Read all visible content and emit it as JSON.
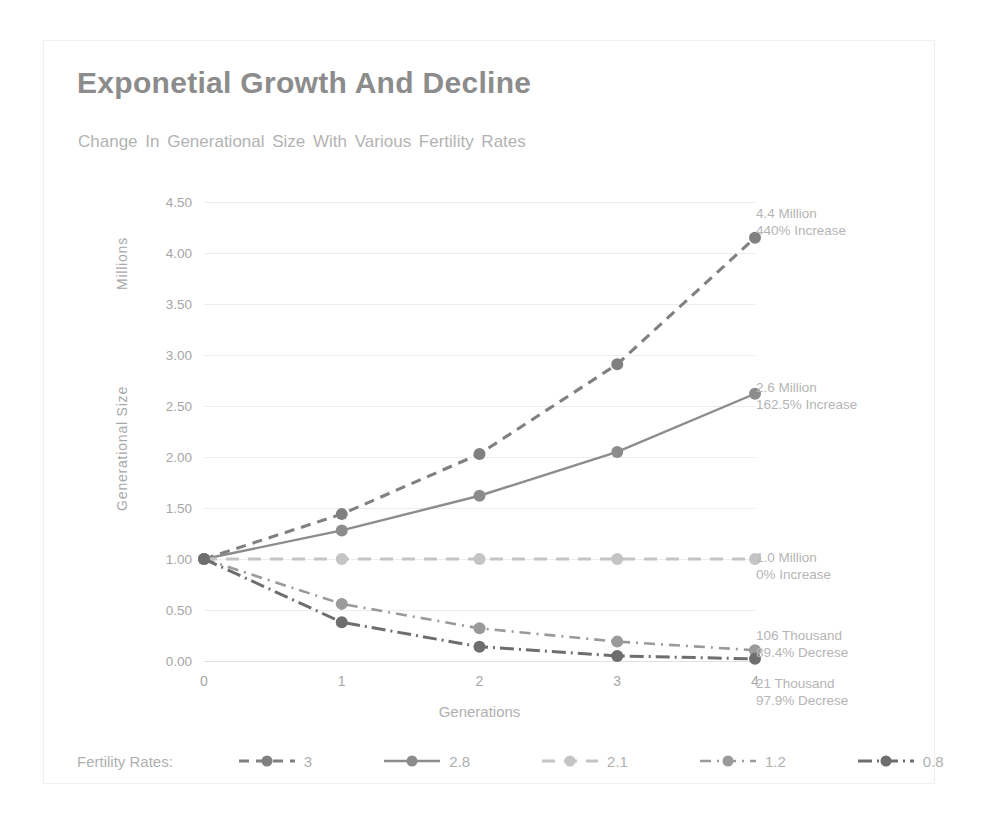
{
  "chart_data": {
    "type": "line",
    "title": "Exponetial Growth And Decline",
    "subtitle": "Change In Generational Size With Various Fertility Rates",
    "xlabel": "Generations",
    "ylabel": "Generational Size",
    "yunits": "Millions",
    "x": [
      0,
      1,
      2,
      3,
      4
    ],
    "categories": [
      "0",
      "1",
      "2",
      "3",
      "4"
    ],
    "xticklabels": [
      "0",
      "1",
      "2",
      "3",
      "4"
    ],
    "yticklabels": [
      "0.00",
      "0.50",
      "1.00",
      "1.50",
      "2.00",
      "2.50",
      "3.00",
      "3.50",
      "4.00",
      "4.50"
    ],
    "yticks": [
      0.0,
      0.5,
      1.0,
      1.5,
      2.0,
      2.5,
      3.0,
      3.5,
      4.0,
      4.5
    ],
    "ylim": [
      0.0,
      4.5
    ],
    "xlim": [
      0,
      4
    ],
    "grid": "horizontal",
    "legend_position": "bottom",
    "legend_title": "Fertility Rates:",
    "series": [
      {
        "name": "3",
        "values": [
          1.0,
          1.44,
          2.03,
          2.91,
          4.15
        ],
        "color": "#808080",
        "dash": "10,7",
        "width": 3.1,
        "marker": "circle"
      },
      {
        "name": "2.8",
        "values": [
          1.0,
          1.28,
          1.62,
          2.05,
          2.62
        ],
        "color": "#8c8c8c",
        "dash": "",
        "width": 2.4,
        "marker": "circle"
      },
      {
        "name": "2.1",
        "values": [
          1.0,
          1.0,
          1.0,
          1.0,
          1.0
        ],
        "color": "#c4c4c4",
        "dash": "13,9",
        "width": 3.0,
        "marker": "circle"
      },
      {
        "name": "1.2",
        "values": [
          1.0,
          0.56,
          0.32,
          0.19,
          0.106
        ],
        "color": "#9a9a9a",
        "dash": "11,6,2,6",
        "width": 2.6,
        "marker": "circle"
      },
      {
        "name": "0.8",
        "values": [
          1.0,
          0.38,
          0.14,
          0.05,
          0.021
        ],
        "color": "#6e6e6e",
        "dash": "14,5,2,5",
        "width": 3.0,
        "marker": "circle"
      }
    ],
    "annotations": [
      {
        "value_text": "4.4 Million",
        "change_text": "440% Increase"
      },
      {
        "value_text": "2.6 Million",
        "change_text": "162.5% Increase"
      },
      {
        "value_text": "1.0 Million",
        "change_text": "0% Increase"
      },
      {
        "value_text": "106 Thousand",
        "change_text": "89.4% Decrese"
      },
      {
        "value_text": "21 Thousand",
        "change_text": "97.9% Decrese"
      }
    ],
    "colors": {
      "title": "#8c8c8c",
      "subtitle": "#b3b3b3",
      "axis_text": "#a6a6a6",
      "gridline": "#ededed",
      "background": "#ffffff"
    }
  }
}
